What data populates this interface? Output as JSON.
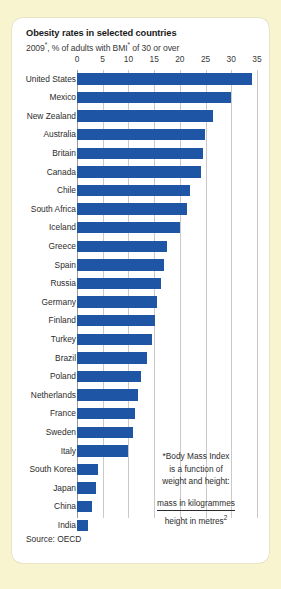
{
  "card": {
    "title": "Obesity rates in selected countries",
    "subtitle_prefix": "2009",
    "subtitle_star1": "*",
    "subtitle_mid": ", % of adults with BMI",
    "subtitle_star2": "*",
    "subtitle_suffix": " of 30 or over",
    "source": "Source: OECD"
  },
  "footnote": {
    "line1": "*Body Mass Index",
    "line2": "is a function of",
    "line3": "weight and height:",
    "numerator": "mass in kilogrammes",
    "denominator_text": "height in metres",
    "denominator_sup": "2"
  },
  "colors": {
    "page_background": "#f7f4cf",
    "card_background": "#ffffff",
    "bar": "#1f55a5",
    "gridline": "#c9c9c9",
    "text": "#2c2c2c"
  },
  "chart_data": {
    "type": "bar",
    "orientation": "horizontal",
    "title": "Obesity rates in selected countries",
    "subtitle": "2009*, % of adults with BMI* of 30 or over",
    "xlabel": "",
    "ylabel": "",
    "xlim": [
      0,
      35
    ],
    "xticks": [
      0,
      5,
      10,
      15,
      20,
      25,
      30,
      35
    ],
    "grid": true,
    "legend": "none",
    "source": "Source: OECD",
    "categories": [
      "United States",
      "Mexico",
      "New Zealand",
      "Australia",
      "Britain",
      "Canada",
      "Chile",
      "South Africa",
      "Iceland",
      "Greece",
      "Spain",
      "Russia",
      "Germany",
      "Finland",
      "Turkey",
      "Brazil",
      "Poland",
      "Netherlands",
      "France",
      "Sweden",
      "Italy",
      "South Korea",
      "Japan",
      "China",
      "India"
    ],
    "values": [
      34.0,
      30.0,
      26.5,
      24.8,
      24.5,
      24.2,
      21.9,
      21.3,
      20.1,
      17.5,
      16.9,
      16.3,
      15.6,
      15.2,
      14.6,
      13.6,
      12.5,
      11.8,
      11.2,
      10.8,
      10.0,
      4.0,
      3.7,
      2.9,
      2.1
    ]
  }
}
